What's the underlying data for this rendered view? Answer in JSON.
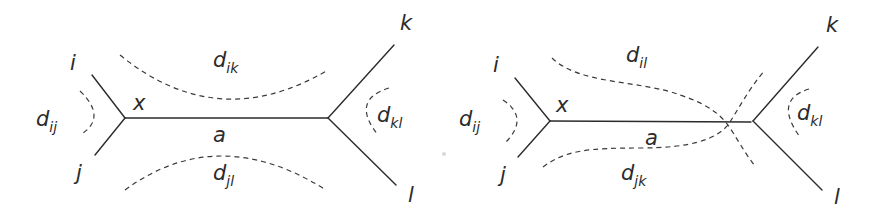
{
  "diagrams": [
    {
      "id": "left",
      "description": "Tree topology with quartet split ij|kl; dashed arcs denote pairwise distances",
      "nodes": {
        "leaf_i": "i",
        "leaf_j": "j",
        "leaf_k": "k",
        "leaf_l": "l",
        "internal_x": "x"
      },
      "edge_label": "a",
      "distances": {
        "d_ij": {
          "base": "d",
          "sub": "ij"
        },
        "d_kl": {
          "base": "d",
          "sub": "kl"
        },
        "d_top": {
          "base": "d",
          "sub": "ik"
        },
        "d_bottom": {
          "base": "d",
          "sub": "jl"
        }
      }
    },
    {
      "id": "right",
      "description": "Same tree; crossing dashed paths denote distances d_il and d_jk that traverse the internal edge",
      "nodes": {
        "leaf_i": "i",
        "leaf_j": "j",
        "leaf_k": "k",
        "leaf_l": "l",
        "internal_x": "x"
      },
      "edge_label": "a",
      "distances": {
        "d_ij": {
          "base": "d",
          "sub": "ij"
        },
        "d_kl": {
          "base": "d",
          "sub": "kl"
        },
        "d_top": {
          "base": "d",
          "sub": "il"
        },
        "d_bottom": {
          "base": "d",
          "sub": "jk"
        }
      }
    }
  ],
  "colors": {
    "line": "#2b2b2b",
    "background": "#ffffff"
  }
}
